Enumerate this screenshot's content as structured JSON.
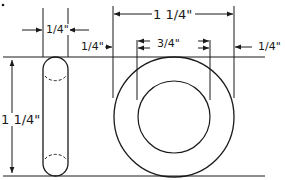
{
  "diagram": {
    "type": "technical-drawing",
    "colors": {
      "ink": "#1a1a1a",
      "background": "#ffffff"
    },
    "views": {
      "side_view": {
        "shape": "rounded-rectangle (ring edge view)",
        "width_label": "1/4\"",
        "height_label": "1 1/4\""
      },
      "front_view": {
        "shape": "concentric circles (ring)",
        "outer_diameter_label": "1 1/4\"",
        "inner_diameter_label": "3/4\"",
        "left_wall_label": "1/4\"",
        "right_wall_label": "1/4\""
      }
    },
    "labels": {
      "side_width": "1/4\"",
      "side_height": "1 1/4\"",
      "outer_diameter": "1 1/4\"",
      "inner_diameter": "3/4\"",
      "wall_left": "1/4\"",
      "wall_right": "1/4\""
    }
  }
}
